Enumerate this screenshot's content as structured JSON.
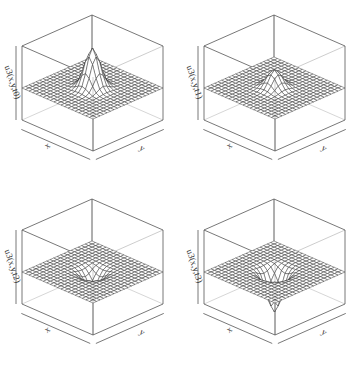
{
  "chart_data": [
    {
      "type": "surface3d",
      "title": "",
      "xlabel": "x",
      "ylabel": "y",
      "zlabel": "u3(x,y,t0)",
      "grid_size": 20,
      "surface": "gaussian bump at center",
      "peak_height": 1.0,
      "direction": "up"
    },
    {
      "type": "surface3d",
      "title": "",
      "xlabel": "x",
      "ylabel": "y",
      "zlabel": "u3(x,y,t1)",
      "grid_size": 20,
      "surface": "gaussian bump at center",
      "peak_height": 0.45,
      "direction": "up"
    },
    {
      "type": "surface3d",
      "title": "",
      "xlabel": "x",
      "ylabel": "y",
      "zlabel": "u3(x,y,t2)",
      "grid_size": 20,
      "surface": "gaussian dip at center",
      "peak_height": -0.45,
      "direction": "down"
    },
    {
      "type": "surface3d",
      "title": "",
      "xlabel": "x",
      "ylabel": "y",
      "zlabel": "u3(x,y,t3)",
      "grid_size": 20,
      "surface": "gaussian dip at center",
      "peak_height": -1.0,
      "direction": "down"
    }
  ],
  "panels": [
    {
      "zlabel": "u3(x,y,t0)",
      "xlabel": "x",
      "ylabel": "y"
    },
    {
      "zlabel": "u3(x,y,t1)",
      "xlabel": "x",
      "ylabel": "y"
    },
    {
      "zlabel": "u3(x,y,t2)",
      "xlabel": "x",
      "ylabel": "y"
    },
    {
      "zlabel": "u3(x,y,t3)",
      "xlabel": "x",
      "ylabel": "y"
    }
  ],
  "colors": {
    "mesh_line": "#2a2a2a",
    "mesh_fill": "#ffffff",
    "box_line": "#555555",
    "back_line": "#bbbbbb"
  }
}
